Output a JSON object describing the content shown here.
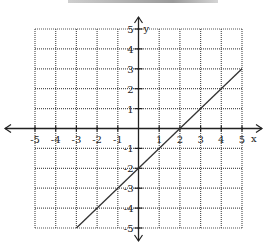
{
  "chart_data": {
    "type": "line",
    "title": "",
    "xlabel": "x",
    "ylabel": "y",
    "xlim": [
      -5,
      5
    ],
    "ylim": [
      -5,
      5
    ],
    "grid": true,
    "grid_style": "dotted",
    "x_ticks": [
      -5,
      -4,
      -3,
      -2,
      -1,
      1,
      2,
      3,
      4,
      5
    ],
    "y_ticks": [
      5,
      4,
      3,
      2,
      1,
      -1,
      -2,
      -3,
      -4,
      -5
    ],
    "x_tick_labels": [
      "-5",
      "-4",
      "-3",
      "-2",
      "-1",
      "1",
      "2",
      "3",
      "4",
      "5"
    ],
    "y_tick_labels": [
      "5",
      "4",
      "3",
      "2",
      "1",
      "-1",
      "-2",
      "-3",
      "-4",
      "-5"
    ],
    "series": [
      {
        "name": "line",
        "equation": "y = x - 2",
        "points": [
          [
            -3,
            -5
          ],
          [
            5,
            3
          ]
        ]
      }
    ],
    "colors": {
      "line": "#333333",
      "grid": "#555555",
      "axis": "#222222"
    }
  },
  "labels": {
    "x_axis": "x",
    "y_axis": "y"
  }
}
